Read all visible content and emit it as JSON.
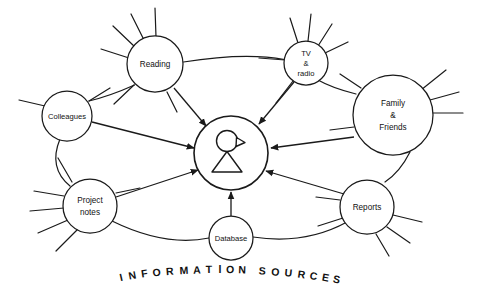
{
  "diagram": {
    "title_caption": "INFORMATION SOURCES",
    "caption_letters": [
      "I",
      "N",
      "F",
      "O",
      "R",
      "M",
      "A",
      "T",
      "I",
      "O",
      "N",
      "S",
      "O",
      "U",
      "R",
      "C",
      "E",
      "S"
    ],
    "center": {
      "id": "information-user",
      "icon": "person-icon",
      "label": ""
    },
    "nodes": [
      {
        "id": "reading",
        "label": "Reading",
        "lines": [
          "Reading"
        ]
      },
      {
        "id": "tv-radio",
        "label": "TV & radio",
        "lines": [
          "TV",
          "&",
          "radio"
        ]
      },
      {
        "id": "family",
        "label": "Family & Friends",
        "lines": [
          "Family",
          "&",
          "Friends"
        ]
      },
      {
        "id": "colleagues",
        "label": "Colleagues",
        "lines": [
          "Colleagues"
        ]
      },
      {
        "id": "project-notes",
        "label": "Project notes",
        "lines": [
          "Project",
          "notes"
        ]
      },
      {
        "id": "database",
        "label": "Database",
        "lines": [
          "Database"
        ]
      },
      {
        "id": "reports",
        "label": "Reports",
        "lines": [
          "Reports"
        ]
      }
    ],
    "arrows_to_center": [
      "reading",
      "tv-radio",
      "family",
      "colleagues",
      "project-notes",
      "database",
      "reports"
    ],
    "ring_links": [
      {
        "from": "reading",
        "to": "tv-radio"
      },
      {
        "from": "tv-radio",
        "to": "family"
      },
      {
        "from": "reading",
        "to": "colleagues"
      },
      {
        "from": "colleagues",
        "to": "project-notes"
      },
      {
        "from": "project-notes",
        "to": "database"
      },
      {
        "from": "database",
        "to": "reports"
      },
      {
        "from": "family",
        "to": "reports"
      }
    ],
    "colors": {
      "stroke": "#1a1a1a",
      "background": "#ffffff",
      "text": "#111111"
    }
  }
}
